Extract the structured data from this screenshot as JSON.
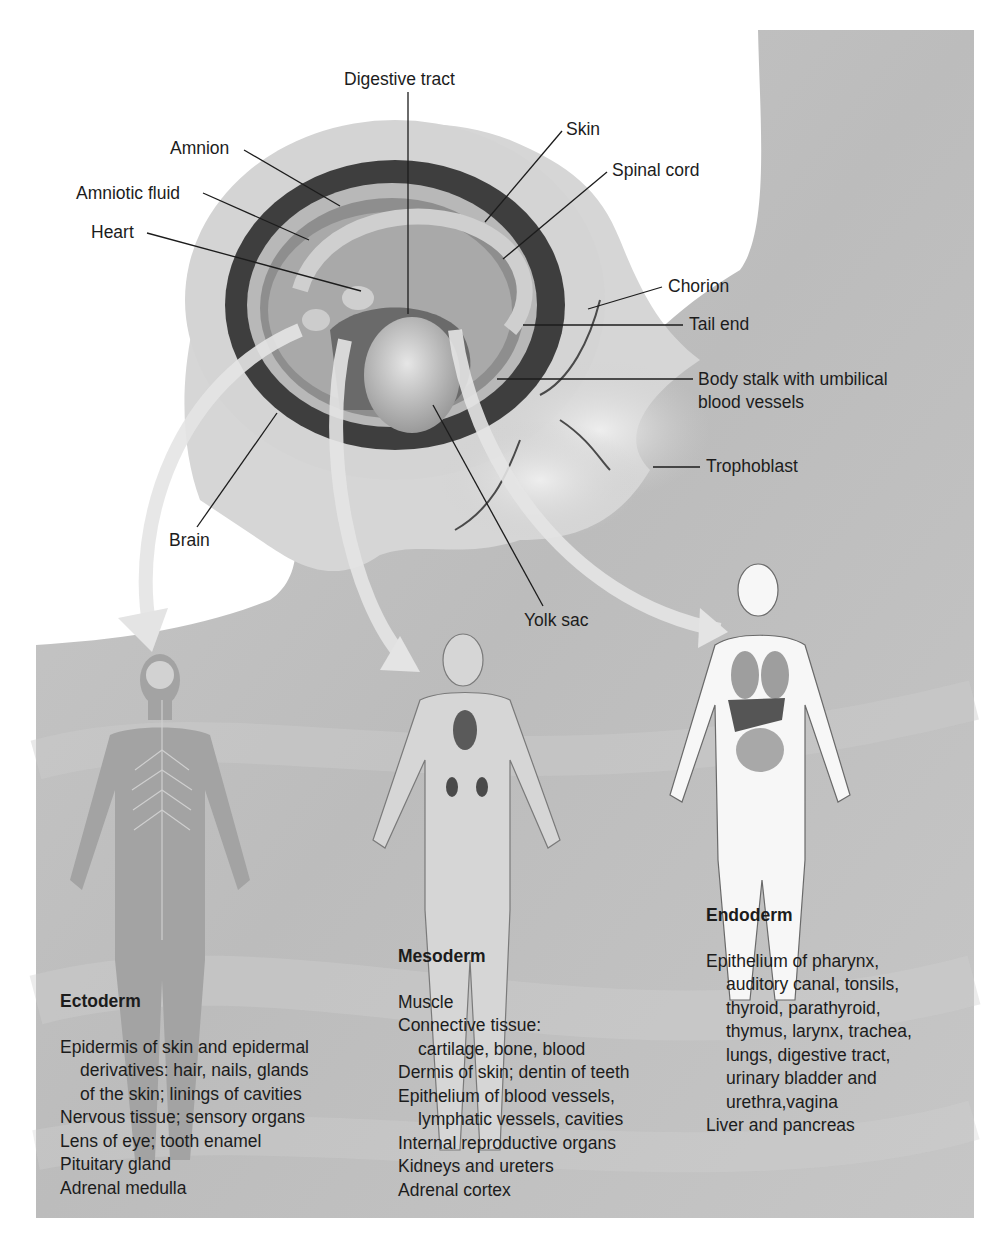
{
  "figure": {
    "background_colors": {
      "page": "#ffffff",
      "panel": "#bdbdbd",
      "panel_light": "#d2d2d2",
      "embryo_dark": "#3a3a3a",
      "embryo_mid": "#a8a8a8",
      "embryo_light": "#dcdcdc",
      "arrow": "#e4e4e4"
    },
    "embryo_labels": [
      {
        "id": "digestive-tract",
        "text": "Digestive tract"
      },
      {
        "id": "amnion",
        "text": "Amnion"
      },
      {
        "id": "amniotic-fluid",
        "text": "Amniotic fluid"
      },
      {
        "id": "heart",
        "text": "Heart"
      },
      {
        "id": "skin",
        "text": "Skin"
      },
      {
        "id": "spinal-cord",
        "text": "Spinal cord"
      },
      {
        "id": "chorion",
        "text": "Chorion"
      },
      {
        "id": "tail-end",
        "text": "Tail end"
      },
      {
        "id": "body-stalk",
        "text": "Body stalk with umbilical",
        "text2": "blood vessels"
      },
      {
        "id": "trophoblast",
        "text": "Trophoblast"
      },
      {
        "id": "brain",
        "text": "Brain"
      },
      {
        "id": "yolk-sac",
        "text": "Yolk sac"
      }
    ],
    "germ_layers": [
      {
        "id": "ectoderm",
        "title": "Ectoderm",
        "items": [
          {
            "text": "Epidermis of skin and epidermal",
            "indent": false
          },
          {
            "text": "derivatives: hair, nails, glands",
            "indent": true
          },
          {
            "text": "of the skin; linings of cavities",
            "indent": true
          },
          {
            "text": "Nervous tissue; sensory organs",
            "indent": false
          },
          {
            "text": "Lens of eye; tooth enamel",
            "indent": false
          },
          {
            "text": "Pituitary gland",
            "indent": false
          },
          {
            "text": "Adrenal medulla",
            "indent": false
          }
        ]
      },
      {
        "id": "mesoderm",
        "title": "Mesoderm",
        "items": [
          {
            "text": "Muscle",
            "indent": false
          },
          {
            "text": "Connective tissue:",
            "indent": false
          },
          {
            "text": "cartilage, bone, blood",
            "indent": true
          },
          {
            "text": "Dermis of skin; dentin of teeth",
            "indent": false
          },
          {
            "text": "Epithelium of blood vessels,",
            "indent": false
          },
          {
            "text": "lymphatic vessels, cavities",
            "indent": true
          },
          {
            "text": "Internal reproductive organs",
            "indent": false
          },
          {
            "text": "Kidneys and ureters",
            "indent": false
          },
          {
            "text": "Adrenal cortex",
            "indent": false
          }
        ]
      },
      {
        "id": "endoderm",
        "title": "Endoderm",
        "items": [
          {
            "text": "Epithelium of pharynx,",
            "indent": false
          },
          {
            "text": "auditory canal, tonsils,",
            "indent": true
          },
          {
            "text": "thyroid, parathyroid,",
            "indent": true
          },
          {
            "text": "thymus, larynx, trachea,",
            "indent": true
          },
          {
            "text": "lungs, digestive tract,",
            "indent": true
          },
          {
            "text": "urinary bladder and",
            "indent": true
          },
          {
            "text": "urethra,vagina",
            "indent": true
          },
          {
            "text": "Liver and pancreas",
            "indent": false
          }
        ]
      }
    ],
    "figures": [
      {
        "id": "ectoderm-figure",
        "depicts": "nervous-system-body"
      },
      {
        "id": "mesoderm-figure",
        "depicts": "musculoskeletal-body"
      },
      {
        "id": "endoderm-figure",
        "depicts": "digestive-organs-body"
      }
    ]
  }
}
